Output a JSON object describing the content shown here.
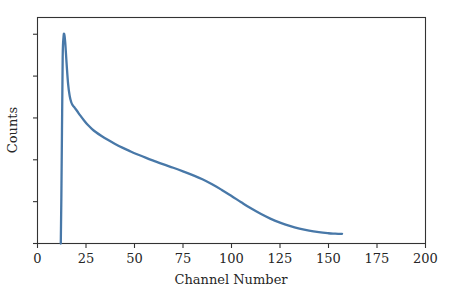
{
  "chart_data": {
    "type": "line",
    "title": "",
    "subtitle": "",
    "xlabel": "Channel Number",
    "ylabel": "Counts",
    "xlim": [
      0,
      200
    ],
    "ylim": [
      0,
      1.08
    ],
    "grid": false,
    "legend": null,
    "legend_position": "none",
    "line_color": "#4878a8",
    "axis_color": "#333333",
    "text_color": "#262626",
    "background_color": "#ffffff",
    "x_ticks": [
      0,
      25,
      50,
      75,
      100,
      125,
      150,
      175,
      200
    ],
    "x_tick_labels": [
      "0",
      "25",
      "50",
      "75",
      "100",
      "125",
      "150",
      "175",
      "200"
    ],
    "y_ticks": [
      0.0,
      0.2,
      0.4,
      0.6,
      0.8,
      1.0
    ],
    "y_tick_labels": [
      "",
      "",
      "",
      "",
      "",
      ""
    ],
    "annotations": [],
    "series": [
      {
        "name": "spectrum",
        "color": "#4878a8",
        "x": [
          12.0,
          12.3,
          12.7,
          13.0,
          13.4,
          13.8,
          14.3,
          15.0,
          15.8,
          16.6,
          17.4,
          18.2,
          19.2,
          20.5,
          22.0,
          24.0,
          26.0,
          28.0,
          30.0,
          33.0,
          36.0,
          40.0,
          44.0,
          48.0,
          52.0,
          56.0,
          60.0,
          65.0,
          70.0,
          75.0,
          80.0,
          85.0,
          90.0,
          95.0,
          100.0,
          105.0,
          110.0,
          115.0,
          120.0,
          125.0,
          130.0,
          135.0,
          140.0,
          145.0,
          150.0,
          153.0,
          155.0,
          157.0
        ],
        "y": [
          0.0,
          0.22,
          0.62,
          0.9,
          0.985,
          1.0,
          0.96,
          0.86,
          0.76,
          0.705,
          0.675,
          0.66,
          0.648,
          0.632,
          0.612,
          0.588,
          0.566,
          0.548,
          0.533,
          0.514,
          0.497,
          0.476,
          0.457,
          0.44,
          0.424,
          0.409,
          0.395,
          0.378,
          0.362,
          0.345,
          0.327,
          0.307,
          0.283,
          0.256,
          0.227,
          0.197,
          0.168,
          0.142,
          0.119,
          0.1,
          0.084,
          0.071,
          0.061,
          0.054,
          0.049,
          0.047,
          0.046,
          0.046
        ]
      }
    ]
  },
  "axes": {
    "x_axis_name": "Channel Number",
    "y_axis_name": "Counts"
  }
}
